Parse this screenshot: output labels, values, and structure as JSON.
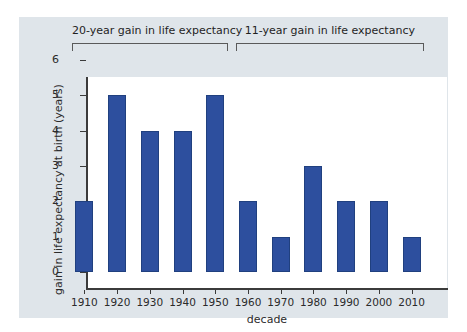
{
  "chart_data": {
    "type": "bar",
    "title": "",
    "xlabel": "decade",
    "ylabel": "gain in life expectancy at birth (years)",
    "categories": [
      "1910",
      "1920",
      "1930",
      "1940",
      "1950",
      "1960",
      "1970",
      "1980",
      "1990",
      "2000",
      "2010"
    ],
    "values": [
      2,
      5,
      4,
      4,
      5,
      2,
      1,
      3,
      2,
      2,
      1
    ],
    "ylim": [
      0,
      6
    ],
    "yticks": [
      0,
      1,
      2,
      3,
      4,
      5,
      6
    ],
    "ytick_labels": [
      "0",
      "1",
      "2",
      "3",
      "4",
      "5",
      "6"
    ],
    "grid": false,
    "legend": "none",
    "bar_color": "#2d4f9e",
    "annotations": [
      {
        "text": "20-year gain in life expectancy",
        "covers": [
          "1910",
          "1920",
          "1930",
          "1940",
          "1950"
        ],
        "total": 20
      },
      {
        "text": "11-year gain in life expectancy",
        "covers": [
          "1960",
          "1970",
          "1980",
          "1990",
          "2000",
          "2010"
        ],
        "total": 11
      }
    ]
  },
  "figure": {
    "panel_background": "#dfe5ea",
    "plot_background": "#ffffff",
    "axis_color": "#3b3b3b",
    "text_color": "#2b2b2b"
  }
}
